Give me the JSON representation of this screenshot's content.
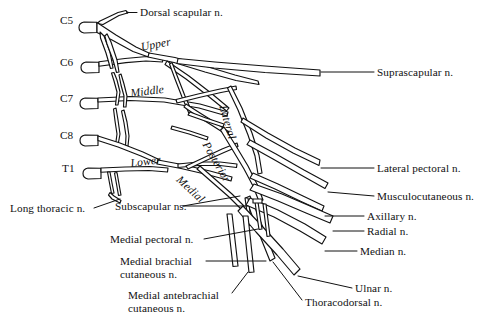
{
  "figure": {
    "type": "anatomical-diagram",
    "background_color": "#ffffff",
    "line_color": "#111111"
  },
  "roots": [
    {
      "label": "C5",
      "x": 60,
      "y": 21
    },
    {
      "label": "C6",
      "x": 60,
      "y": 63
    },
    {
      "label": "C7",
      "x": 60,
      "y": 99
    },
    {
      "label": "C8",
      "x": 60,
      "y": 136
    },
    {
      "label": "T1",
      "x": 62,
      "y": 169
    }
  ],
  "trunks": [
    {
      "label": "Upper",
      "x": 140,
      "y": 48,
      "rotation": -11
    },
    {
      "label": "Middle",
      "x": 130,
      "y": 93,
      "rotation": -7
    },
    {
      "label": "Lower",
      "x": 130,
      "y": 163,
      "rotation": -7
    }
  ],
  "cords": [
    {
      "label": "Lateral",
      "x": 228,
      "y": 104,
      "rotation": 74
    },
    {
      "label": "Posterior",
      "x": 210,
      "y": 140,
      "rotation": 60
    },
    {
      "label": "Medial",
      "x": 182,
      "y": 174,
      "rotation": 43
    }
  ],
  "branch_labels_right": [
    {
      "label": "Suprascapular n.",
      "x": 377,
      "y": 67
    },
    {
      "label": "Lateral pectoral n.",
      "x": 377,
      "y": 163
    },
    {
      "label": "Musculocutaneous n.",
      "x": 377,
      "y": 191
    },
    {
      "label": "Axillary n.",
      "x": 367,
      "y": 211
    },
    {
      "label": "Radial n.",
      "x": 367,
      "y": 226
    },
    {
      "label": "Median n.",
      "x": 360,
      "y": 246
    },
    {
      "label": "Ulnar n.",
      "x": 355,
      "y": 285
    },
    {
      "label": "Thoracodorsal n.",
      "x": 305,
      "y": 302
    }
  ],
  "branch_labels_top": [
    {
      "label": "Dorsal scapular n.",
      "x": 140,
      "y": 10
    }
  ],
  "branch_labels_left": [
    {
      "label": "Long thoracic n.",
      "x": 10,
      "y": 203
    },
    {
      "label": "Subscapular ns.",
      "x": 115,
      "y": 203
    },
    {
      "label": "Medial pectoral n.",
      "x": 110,
      "y": 234
    },
    {
      "label": "Medial brachial\ncutaneous n.",
      "x": 120,
      "y": 258
    },
    {
      "label": "Medial antebrachial\ncutaneous n.",
      "x": 128,
      "y": 292
    }
  ]
}
